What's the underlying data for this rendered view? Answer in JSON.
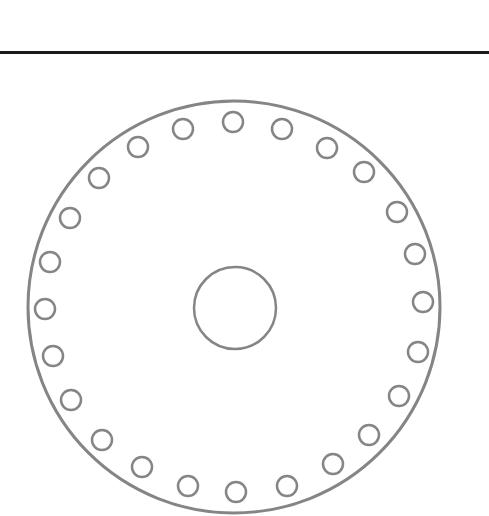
{
  "diagram": {
    "type": "disc-with-hole-ring",
    "rule": {
      "y": 52,
      "color": "#1a1a1a",
      "thickness": 3
    },
    "stroke_color": "#858585",
    "outer_circle": {
      "cx": 234,
      "cy": 307,
      "r": 206,
      "stroke_width": 3
    },
    "center_circle": {
      "cx": 235,
      "cy": 308,
      "r": 41,
      "stroke_width": 2.5
    },
    "hole_radius": 10,
    "hole_stroke_width": 2.5,
    "holes": [
      [
        233,
        122
      ],
      [
        282,
        129
      ],
      [
        327,
        148
      ],
      [
        364,
        172
      ],
      [
        397,
        212
      ],
      [
        415,
        254
      ],
      [
        423,
        302
      ],
      [
        418,
        352
      ],
      [
        399,
        396
      ],
      [
        369,
        435
      ],
      [
        333,
        464
      ],
      [
        287,
        486
      ],
      [
        236,
        492
      ],
      [
        188,
        486
      ],
      [
        142,
        467
      ],
      [
        102,
        440
      ],
      [
        71,
        400
      ],
      [
        53,
        356
      ],
      [
        45,
        309
      ],
      [
        50,
        262
      ],
      [
        70,
        218
      ],
      [
        99,
        178
      ],
      [
        138,
        147
      ],
      [
        183,
        129
      ]
    ],
    "hole_count": 24
  }
}
